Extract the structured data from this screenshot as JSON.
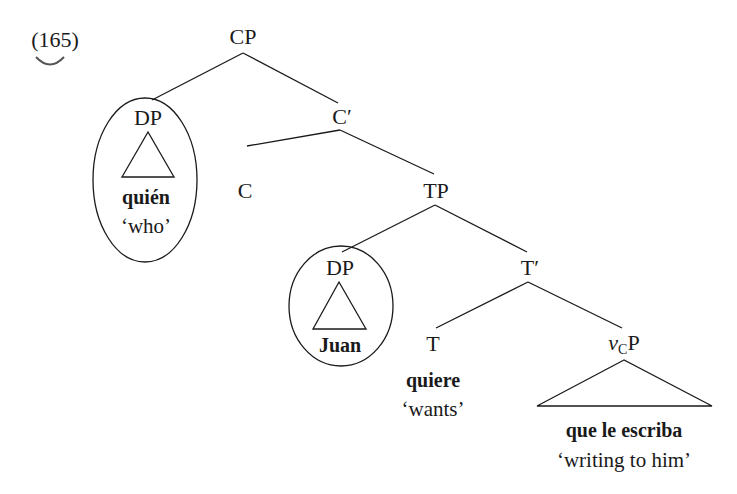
{
  "example_number": "(165)",
  "tree": {
    "root": {
      "label": "CP"
    },
    "spec_cp": {
      "label": "DP",
      "word": "quién",
      "gloss": "‘who’",
      "circled": true
    },
    "c_bar": {
      "label": "C′"
    },
    "c_head": {
      "label": "C"
    },
    "tp": {
      "label": "TP"
    },
    "spec_tp": {
      "label": "DP",
      "word": "Juan",
      "circled": true
    },
    "t_bar": {
      "label": "T′"
    },
    "t_head": {
      "label": "T",
      "word": "quiere",
      "gloss": "‘wants’"
    },
    "vcp": {
      "label_v": "v",
      "label_sub": "C",
      "label_p": "P",
      "word": "que le escriba",
      "gloss": "‘writing to him’"
    }
  },
  "colors": {
    "ink": "#1a1a1a",
    "background": "#ffffff"
  }
}
